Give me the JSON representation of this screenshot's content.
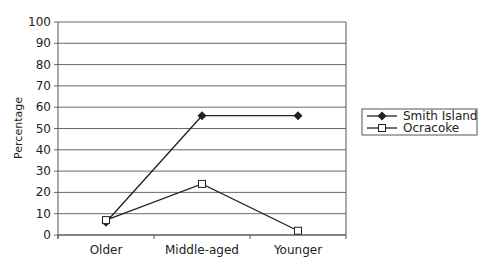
{
  "chart_data": {
    "type": "line",
    "title": "",
    "xlabel": "",
    "ylabel": "Percentage",
    "ylim": [
      0,
      100
    ],
    "yticks": [
      0,
      10,
      20,
      30,
      40,
      50,
      60,
      70,
      80,
      90,
      100
    ],
    "categories": [
      "Older",
      "Middle-aged",
      "Younger"
    ],
    "grid": true,
    "legend_position": "right",
    "series": [
      {
        "name": "Smith Island",
        "marker": "filled-diamond",
        "values": [
          6,
          56,
          56
        ]
      },
      {
        "name": "Ocracoke",
        "marker": "open-square",
        "values": [
          7,
          24,
          2
        ]
      }
    ]
  },
  "colors": {
    "line": "#222222",
    "grid": "#444444",
    "axis": "#555555"
  }
}
